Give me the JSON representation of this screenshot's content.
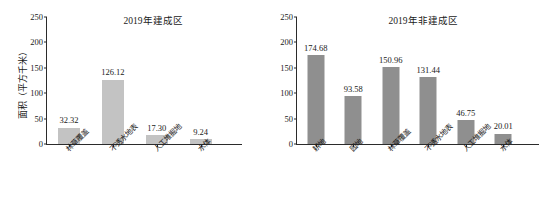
{
  "chart_data": [
    {
      "type": "bar",
      "title": "2019年建成区",
      "xlabel": "",
      "ylabel": "面积（平方千米）",
      "ylim": [
        0,
        250
      ],
      "yticks": [
        "0",
        "50",
        "100",
        "150",
        "200",
        "250"
      ],
      "grid": false,
      "legend": "none",
      "bar_color": "#c3c3c3",
      "categories": [
        "林草覆盖",
        "不透水地表",
        "人工堆掘地",
        "水体"
      ],
      "values": [
        32.32,
        126.12,
        17.3,
        9.24
      ],
      "value_labels": [
        "32.32",
        "126.12",
        "17.30",
        "9.24"
      ]
    },
    {
      "type": "bar",
      "title": "2019年非建成区",
      "xlabel": "",
      "ylabel": "",
      "ylim": [
        0,
        250
      ],
      "yticks": [
        "0",
        "50",
        "100",
        "150",
        "200",
        "250"
      ],
      "grid": false,
      "legend": "none",
      "bar_color": "#8f8f8f",
      "categories": [
        "耕地",
        "园地",
        "林草覆盖",
        "不透水地表",
        "人工堆掘地",
        "水体"
      ],
      "values": [
        174.68,
        93.58,
        150.96,
        131.44,
        46.75,
        20.01
      ],
      "value_labels": [
        "174.68",
        "93.58",
        "150.96",
        "131.44",
        "46.75",
        "20.01"
      ]
    }
  ]
}
